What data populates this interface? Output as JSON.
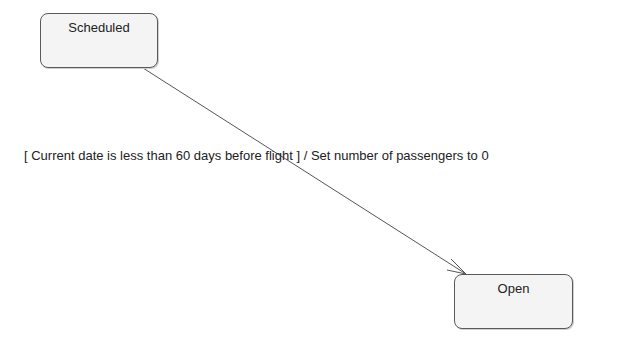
{
  "diagram": {
    "type": "state-machine",
    "states": [
      {
        "id": "scheduled",
        "label": "Scheduled"
      },
      {
        "id": "open",
        "label": "Open"
      }
    ],
    "transitions": [
      {
        "from": "scheduled",
        "to": "open",
        "label": "[ Current date is less than 60 days before flight ] / Set number of passengers to 0"
      }
    ],
    "colors": {
      "state_fill": "#f4f4f4",
      "state_border": "#5a5a5a",
      "line": "#555555",
      "text": "#222222"
    }
  }
}
